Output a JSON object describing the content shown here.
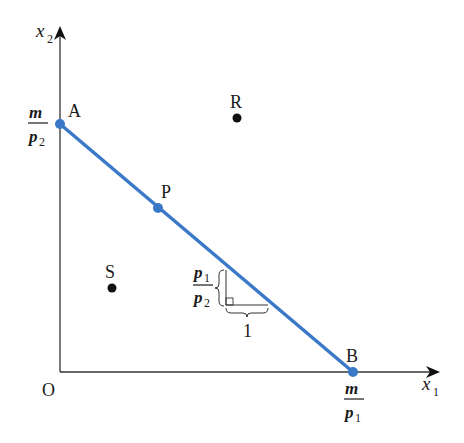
{
  "diagram": {
    "type": "budget-line",
    "axes": {
      "x_label": "x",
      "x_sub": "1",
      "y_label": "x",
      "y_sub": "2",
      "origin_label": "O"
    },
    "budget_line": {
      "color": "#3a78c8",
      "start_point": "A",
      "end_point": "B"
    },
    "points": {
      "A": {
        "label": "A",
        "on_line": true
      },
      "B": {
        "label": "B",
        "on_line": true
      },
      "P": {
        "label": "P",
        "on_line": true
      },
      "R": {
        "label": "R",
        "on_line": false
      },
      "S": {
        "label": "S",
        "on_line": false
      }
    },
    "intercepts": {
      "y": {
        "numerator": "m",
        "denominator": "p",
        "denominator_sub": "2"
      },
      "x": {
        "numerator": "m",
        "denominator": "p",
        "denominator_sub": "1"
      }
    },
    "slope_annotation": {
      "rise_numerator": "p",
      "rise_numerator_sub": "1",
      "rise_denominator": "p",
      "rise_denominator_sub": "2",
      "run": "1"
    },
    "colors": {
      "line": "#3a78c8",
      "axis": "#333333",
      "point_offline": "#111111",
      "text": "#1a1a1a"
    }
  }
}
